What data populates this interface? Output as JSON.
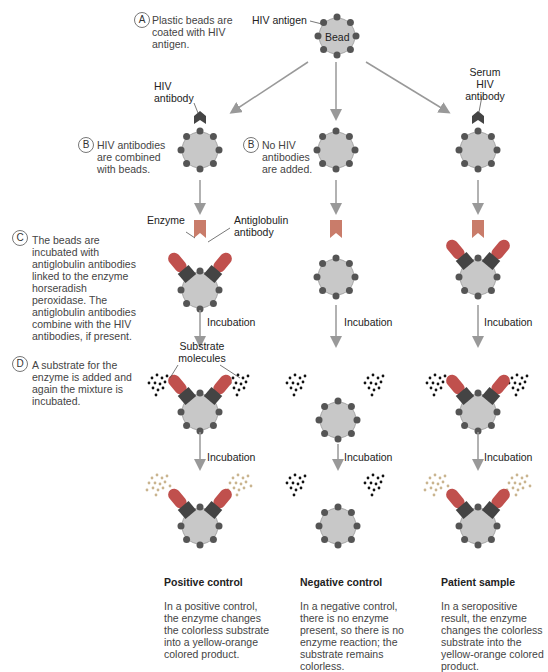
{
  "steps": {
    "A": {
      "badge": "A",
      "text": "Plastic beads are\ncoated with HIV\nantigen."
    },
    "B1": {
      "badge": "B",
      "text": "HIV antibodies\nare combined\nwith beads."
    },
    "B2": {
      "badge": "B",
      "text": "No HIV\nantibodies\nare added."
    },
    "C": {
      "badge": "C",
      "text": "The beads are\nincubated with\nantiglobulin antibodies\nlinked to the enzyme\nhorseradish\nperoxidase. The\nantiglobulin antibodies\ncombine with the HIV\nantibodies, if present."
    },
    "D": {
      "badge": "D",
      "text": "A substrate for the\nenzyme is added and\nagain the mixture is\nincubated."
    }
  },
  "labels": {
    "hiv_antigen": "HIV antigen",
    "bead": "Bead",
    "hiv_antibody": "HIV\nantibody",
    "serum_hiv_antibody": "Serum\nHIV\nantibody",
    "enzyme": "Enzyme",
    "antiglobulin_antibody": "Antiglobulin\nantibody",
    "substrate_molecules": "Substrate\nmolecules",
    "incubation": "Incubation"
  },
  "results": [
    {
      "title": "Positive control",
      "text": "In a positive control,\nthe enzyme changes\nthe colorless substrate\ninto a yellow-orange\ncolored product."
    },
    {
      "title": "Negative control",
      "text": "In a negative control,\nthere is no enzyme\npresent, so there is no\nenzyme reaction; the\nsubstrate remains\ncolorless."
    },
    {
      "title": "Patient sample",
      "text": "In a seropositive\nresult, the enzyme\nchanges the colorless\nsubstrate into the\nyellow-orange colored\nproduct."
    }
  ],
  "colors": {
    "bead_fill": "#c8c8c8",
    "antigen": "#555555",
    "antibody_dark": "#444444",
    "antiglobulin": "#c0504d",
    "enzyme": "#c97c6a",
    "substrate": "#111111",
    "product": "#c9b48f",
    "arrow": "#999999"
  }
}
